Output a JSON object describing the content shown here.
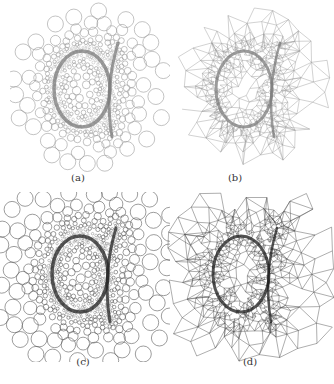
{
  "figure": {
    "panels": [
      {
        "id": "a",
        "label": "(a)",
        "type": "circle-packing",
        "x": 10,
        "y": 2,
        "w": 160,
        "h": 170,
        "cx": 80,
        "cy": 85,
        "stroke": "#9a9a9a",
        "curve": "#7a7a7a",
        "seed": 3,
        "extent": 78
      },
      {
        "id": "b",
        "label": "(b)",
        "type": "triangle-mesh",
        "x": 172,
        "y": 2,
        "w": 160,
        "h": 170,
        "cx": 80,
        "cy": 85,
        "stroke": "#9a9a9a",
        "curve": "#7a7a7a",
        "seed": 7,
        "extent": 80
      },
      {
        "id": "c",
        "label": "(c)",
        "type": "circle-packing",
        "x": 0,
        "y": 192,
        "w": 170,
        "h": 170,
        "cx": 88,
        "cy": 80,
        "stroke": "#5a5a5a",
        "curve": "#222222",
        "seed": 11,
        "extent": 100
      },
      {
        "id": "d",
        "label": "(d)",
        "type": "triangle-mesh",
        "x": 167,
        "y": 192,
        "w": 167,
        "h": 170,
        "cx": 82,
        "cy": 80,
        "stroke": "#4a4a4a",
        "curve": "#1a1a1a",
        "seed": 13,
        "extent": 100
      }
    ],
    "captions": {
      "a": "(a)",
      "b": "(b)",
      "c": "(c)",
      "d": "(d)"
    },
    "caption_positions": {
      "a": {
        "x": 66,
        "y": 172
      },
      "b": {
        "x": 223,
        "y": 172
      },
      "c": {
        "x": 71,
        "y": 356
      },
      "d": {
        "x": 238,
        "y": 356
      }
    }
  }
}
